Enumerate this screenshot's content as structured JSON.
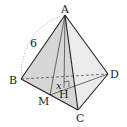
{
  "diagram": {
    "type": "tetrahedron",
    "vertices": {
      "A": {
        "label": "A",
        "x": 65,
        "y": 15
      },
      "B": {
        "label": "B",
        "x": 21,
        "y": 79
      },
      "C": {
        "label": "C",
        "x": 78,
        "y": 110
      },
      "D": {
        "label": "D",
        "x": 108,
        "y": 74
      },
      "M": {
        "label": "M",
        "x": 50,
        "y": 95
      },
      "H": {
        "label": "H",
        "x": 64,
        "y": 88
      }
    },
    "edge_length_label": "6",
    "angle_label": "x",
    "colors": {
      "edge": "#222222",
      "face_left": "#d4d4d4",
      "face_right": "#e9e9e9",
      "hidden": "#444444",
      "arc": "#999999"
    }
  }
}
